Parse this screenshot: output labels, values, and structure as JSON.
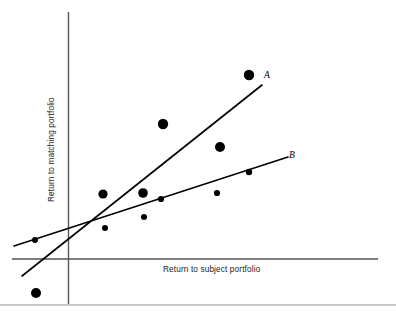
{
  "figure": {
    "background_color": "#ffffff",
    "width": 396,
    "height": 316
  },
  "axes": {
    "y_axis_label": "Return to matching portfolio",
    "x_axis_label": "Return to subject portfolio",
    "axis_color": "#555555",
    "origin": {
      "x": 68.5,
      "y": 259
    },
    "y_axis_top": 12,
    "x_axis_right": 378
  },
  "lines": [
    {
      "name": "A",
      "label": "A",
      "color": "#000000",
      "stroke_width": 1.6,
      "x1": 22,
      "y1": 276,
      "x2": 262,
      "y2": 85
    },
    {
      "name": "B",
      "label": "B",
      "color": "#000000",
      "stroke_width": 1.6,
      "x1": 14,
      "y1": 246,
      "x2": 288,
      "y2": 157
    }
  ],
  "chart_data": {
    "type": "scatter",
    "title": "",
    "xlabel": "Return to subject portfolio",
    "ylabel": "Return to matching portfolio",
    "grid": false,
    "legend": "none",
    "axis_ticks": "none",
    "marker_color": "#000000",
    "annotations": [
      {
        "text": "A",
        "kind": "line-label",
        "style": "italic",
        "x": 266,
        "y": 77
      },
      {
        "text": "B",
        "kind": "line-label",
        "style": "italic",
        "x": 291,
        "y": 157
      }
    ],
    "series": [
      {
        "name": "observations",
        "points": [
          {
            "x": 35,
            "y": 240,
            "r": 3.0
          },
          {
            "x": 36,
            "y": 293,
            "r": 5.0
          },
          {
            "x": 103,
            "y": 194,
            "r": 4.6
          },
          {
            "x": 105,
            "y": 228,
            "r": 3.0
          },
          {
            "x": 143,
            "y": 193,
            "r": 4.8
          },
          {
            "x": 144,
            "y": 217,
            "r": 3.0
          },
          {
            "x": 161,
            "y": 199,
            "r": 3.1
          },
          {
            "x": 163,
            "y": 124,
            "r": 5.2
          },
          {
            "x": 217,
            "y": 193,
            "r": 3.1
          },
          {
            "x": 220,
            "y": 147,
            "r": 5.0
          },
          {
            "x": 249,
            "y": 172,
            "r": 3.2
          },
          {
            "x": 249,
            "y": 75,
            "r": 5.2
          }
        ]
      }
    ],
    "trend_lines": [
      {
        "name": "A",
        "description": "steeper regression line labelled A"
      },
      {
        "name": "B",
        "description": "flatter regression line labelled B"
      }
    ]
  }
}
